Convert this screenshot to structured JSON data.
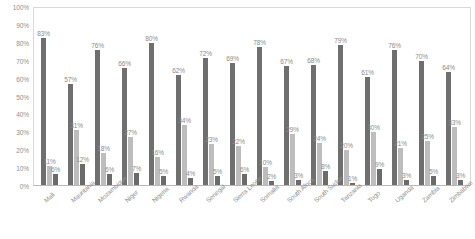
{
  "chart_data": {
    "type": "bar",
    "title": "",
    "subtitle": "",
    "xlabel": "",
    "ylabel": "",
    "ylim": [
      0,
      100
    ],
    "grid": false,
    "legend": "none",
    "value_suffix": "%",
    "y_ticks": [
      "100%",
      "90%",
      "80%",
      "70%",
      "60%",
      "50%",
      "40%",
      "30%",
      "20%",
      "10%",
      "0%"
    ],
    "y_tick_values": [
      100,
      90,
      80,
      70,
      60,
      50,
      40,
      30,
      20,
      10,
      0
    ],
    "categories": [
      "Mali",
      "Mauritania",
      "Mozambique",
      "Niger",
      "Nigeria",
      "Rwanda",
      "Senegal",
      "Sierra Leone",
      "Somalia",
      "South Africa",
      "South Sudan",
      "Tanzania",
      "Togo",
      "Uganda",
      "Zambia",
      "Zimbabwe"
    ],
    "series": [
      {
        "name": "series-1",
        "color": "#6f6f6f",
        "values": [
          83,
          57,
          76,
          66,
          80,
          62,
          72,
          69,
          78,
          67,
          68,
          79,
          61,
          76,
          70,
          64
        ],
        "labels": [
          "83%",
          "57%",
          "76%",
          "66%",
          "80%",
          "62%",
          "72%",
          "69%",
          "78%",
          "67%",
          "68%",
          "79%",
          "61%",
          "76%",
          "70%",
          "64%"
        ]
      },
      {
        "name": "series-2",
        "color": "#bdbdbd",
        "values": [
          11,
          31,
          18,
          27,
          16,
          34,
          23,
          22,
          10,
          29,
          24,
          20,
          30,
          21,
          25,
          33
        ],
        "labels": [
          "11%",
          "31%",
          "18%",
          "27%",
          "16%",
          "34%",
          "23%",
          "22%",
          "10%",
          "29%",
          "24%",
          "20%",
          "30%",
          "21%",
          "25%",
          "33%"
        ]
      },
      {
        "name": "series-3",
        "color": "#6b6b6b",
        "values": [
          6,
          12,
          6,
          7,
          5,
          4,
          5,
          6,
          2,
          3,
          8,
          1,
          9,
          3,
          5,
          3
        ],
        "labels": [
          "6%",
          "12%",
          "6%",
          "7%",
          "5%",
          "4%",
          "5%",
          "6%",
          "2%",
          "3%",
          "8%",
          "1%",
          "9%",
          "3%",
          "5%",
          "3%"
        ]
      }
    ]
  }
}
